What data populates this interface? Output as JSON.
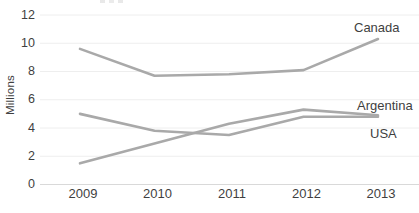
{
  "chart_data": {
    "type": "line",
    "title": "",
    "xlabel": "",
    "ylabel": "Millions",
    "categories": [
      "2009",
      "2010",
      "2011",
      "2012",
      "2013"
    ],
    "series": [
      {
        "name": "Canada",
        "values": [
          9.6,
          7.7,
          7.8,
          8.1,
          10.3
        ]
      },
      {
        "name": "Argentina",
        "values": [
          1.5,
          2.9,
          4.3,
          5.3,
          4.9
        ]
      },
      {
        "name": "USA",
        "values": [
          5.0,
          3.8,
          3.5,
          4.8,
          4.8
        ]
      }
    ],
    "y_ticks": [
      0,
      2,
      4,
      6,
      8,
      10,
      12
    ],
    "ylim": [
      0,
      12
    ],
    "grid": "horizontal-only",
    "legend_position": "inline-right-of-lines",
    "line_color": "#a9a9a9",
    "gridline_color": "#eeeeee",
    "baseline_color": "#d9d9d9",
    "axis_text_color": "#3f3f3f"
  }
}
